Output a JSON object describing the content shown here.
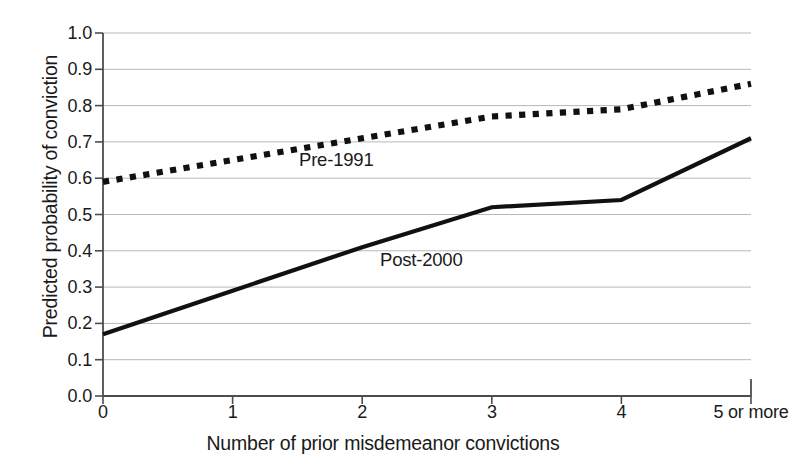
{
  "chart_data": {
    "type": "line",
    "title": "",
    "xlabel": "Number of prior misdemeanor convictions",
    "ylabel": "Predicted probability of conviction",
    "categories": [
      "0",
      "1",
      "2",
      "3",
      "4",
      "5 or more"
    ],
    "x": [
      0,
      1,
      2,
      3,
      4,
      5
    ],
    "xlim": [
      0,
      5
    ],
    "ylim": [
      0.0,
      1.0
    ],
    "yticks": [
      "1.0",
      "0.9",
      "0.8",
      "0.7",
      "0.6",
      "0.5",
      "0.4",
      "0.3",
      "0.2",
      "0.1",
      "0.0"
    ],
    "ytick_values": [
      1.0,
      0.9,
      0.8,
      0.7,
      0.6,
      0.5,
      0.4,
      0.3,
      0.2,
      0.1,
      0.0
    ],
    "grid": true,
    "grid_axis": "y",
    "legend_position": "inline-annotations",
    "series": [
      {
        "name": "Pre-1991",
        "style": "dotted",
        "color": "#111111",
        "values": [
          0.59,
          0.65,
          0.71,
          0.77,
          0.79,
          0.86
        ],
        "label_x": 2.05,
        "label_y": 0.67
      },
      {
        "name": "Post-2000",
        "style": "solid",
        "color": "#111111",
        "values": [
          0.17,
          0.29,
          0.41,
          0.52,
          0.54,
          0.71
        ],
        "label_x": 2.87,
        "label_y": 0.4
      }
    ],
    "colors": {
      "axis": "#4d4d4d",
      "grid": "#b8b8b8",
      "text": "#1a1a1a",
      "background": "#ffffff"
    }
  },
  "axis": {
    "ylabel": "Predicted probability of conviction",
    "xlabel": "Number of prior misdemeanor convictions"
  },
  "annotations": {
    "pre": "Pre-1991",
    "post": "Post-2000"
  }
}
